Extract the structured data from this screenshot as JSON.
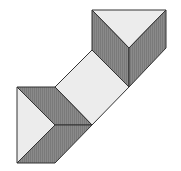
{
  "diagram": {
    "title": "",
    "colors": {
      "background": "#ffffff",
      "dark_face": "#8a8a8a",
      "light_face": "#ececec",
      "stroke": "#333333"
    },
    "shapes": [
      {
        "name": "top-triangle-light",
        "fill": "light",
        "points": "92,10 166,10 129,48"
      },
      {
        "name": "top-left-face-dark",
        "fill": "dark",
        "points": "92,10 129,48 129,87 92,50"
      },
      {
        "name": "top-right-face-dark",
        "fill": "dark",
        "points": "166,10 166,48 129,87 129,48"
      },
      {
        "name": "center-rhombus-light",
        "fill": "light",
        "points": "55,87 92,50 129,87 92,125"
      },
      {
        "name": "bottom-left-triangle-light",
        "fill": "light",
        "points": "17,87 55,125 17,163"
      },
      {
        "name": "bottom-upper-face-dark",
        "fill": "dark",
        "points": "17,87 55,87 92,125 55,125"
      },
      {
        "name": "bottom-lower-face-dark",
        "fill": "dark",
        "points": "55,125 92,125 55,163 17,163"
      }
    ]
  }
}
